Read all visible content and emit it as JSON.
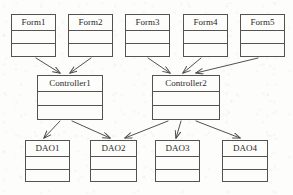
{
  "diagram": {
    "type": "uml-class-diagram",
    "canvas": {
      "width": 293,
      "height": 195
    },
    "style": {
      "background_color": "#fdfdfc",
      "line_color": "#555250",
      "text_color": "#2b2926"
    },
    "nodes": [
      {
        "id": "form1",
        "label": "Form1",
        "layer": "presentation",
        "x": 11,
        "y": 14,
        "w": 45,
        "h": 43
      },
      {
        "id": "form2",
        "label": "Form2",
        "layer": "presentation",
        "x": 68,
        "y": 14,
        "w": 45,
        "h": 43
      },
      {
        "id": "form3",
        "label": "Form3",
        "layer": "presentation",
        "x": 125,
        "y": 14,
        "w": 45,
        "h": 43
      },
      {
        "id": "form4",
        "label": "Form4",
        "layer": "presentation",
        "x": 183,
        "y": 14,
        "w": 45,
        "h": 43
      },
      {
        "id": "form5",
        "label": "Form5",
        "layer": "presentation",
        "x": 240,
        "y": 14,
        "w": 45,
        "h": 43
      },
      {
        "id": "controller1",
        "label": "Controller1",
        "layer": "control",
        "x": 37,
        "y": 75,
        "w": 66,
        "h": 45
      },
      {
        "id": "controller2",
        "label": "Controller2",
        "layer": "control",
        "x": 152,
        "y": 75,
        "w": 68,
        "h": 45
      },
      {
        "id": "dao1",
        "label": "DAO1",
        "layer": "data-access",
        "x": 25,
        "y": 140,
        "w": 45,
        "h": 42
      },
      {
        "id": "dao2",
        "label": "DAO2",
        "layer": "data-access",
        "x": 90,
        "y": 140,
        "w": 47,
        "h": 42
      },
      {
        "id": "dao3",
        "label": "DAO3",
        "layer": "data-access",
        "x": 155,
        "y": 140,
        "w": 45,
        "h": 42
      },
      {
        "id": "dao4",
        "label": "DAO4",
        "layer": "data-access",
        "x": 222,
        "y": 140,
        "w": 46,
        "h": 42
      }
    ],
    "edges": [
      {
        "id": "e-form1-controller1",
        "from": "form1",
        "to": "controller1",
        "x1": 36,
        "y1": 58,
        "x2": 60,
        "y2": 73
      },
      {
        "id": "e-form2-controller1",
        "from": "form2",
        "to": "controller1",
        "x1": 91,
        "y1": 58,
        "x2": 70,
        "y2": 73
      },
      {
        "id": "e-form3-controller2",
        "from": "form3",
        "to": "controller2",
        "x1": 148,
        "y1": 58,
        "x2": 170,
        "y2": 73
      },
      {
        "id": "e-form4-controller2",
        "from": "form4",
        "to": "controller2",
        "x1": 201,
        "y1": 58,
        "x2": 183,
        "y2": 73
      },
      {
        "id": "e-form5-controller2",
        "from": "form5",
        "to": "controller2",
        "x1": 258,
        "y1": 58,
        "x2": 196,
        "y2": 73
      },
      {
        "id": "e-controller1-dao1",
        "from": "controller1",
        "to": "dao1",
        "x1": 60,
        "y1": 121,
        "x2": 44,
        "y2": 138
      },
      {
        "id": "e-controller1-dao2",
        "from": "controller1",
        "to": "dao2",
        "x1": 72,
        "y1": 121,
        "x2": 110,
        "y2": 138
      },
      {
        "id": "e-controller2-dao2",
        "from": "controller2",
        "to": "dao2",
        "x1": 168,
        "y1": 121,
        "x2": 125,
        "y2": 138
      },
      {
        "id": "e-controller2-dao3",
        "from": "controller2",
        "to": "dao3",
        "x1": 181,
        "y1": 121,
        "x2": 176,
        "y2": 138
      },
      {
        "id": "e-controller2-dao4",
        "from": "controller2",
        "to": "dao4",
        "x1": 196,
        "y1": 121,
        "x2": 240,
        "y2": 138
      }
    ]
  }
}
